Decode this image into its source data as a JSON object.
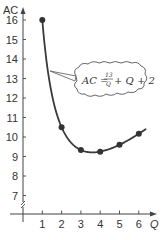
{
  "chart_data": {
    "type": "line",
    "title": "",
    "xlabel": "Q",
    "ylabel": "AC",
    "x": [
      1,
      2,
      3,
      4,
      5,
      6
    ],
    "series": [
      {
        "name": "AC",
        "values": [
          16,
          10.5,
          9.33,
          9.25,
          9.6,
          10.17
        ]
      }
    ],
    "xlim": [
      0,
      6.5
    ],
    "ylim": [
      6,
      16.5
    ],
    "x_ticks": [
      "1",
      "2",
      "3",
      "4",
      "5",
      "6"
    ],
    "y_ticks": [
      "7",
      "8",
      "9",
      "10",
      "11",
      "12",
      "13",
      "14",
      "15",
      "16"
    ],
    "y_axis_break": true,
    "grid": false,
    "markers": true,
    "annotation": {
      "text": "AC = 13/Q + Q + 2",
      "lhs": "AC =",
      "numerator": "13",
      "denominator": "Q",
      "rhs": "+ Q + 2",
      "shape": "cloud-callout"
    }
  },
  "colors": {
    "line": "#3a3a3a",
    "marker": "#333333",
    "axis": "#444444",
    "background": "#ffffff"
  }
}
